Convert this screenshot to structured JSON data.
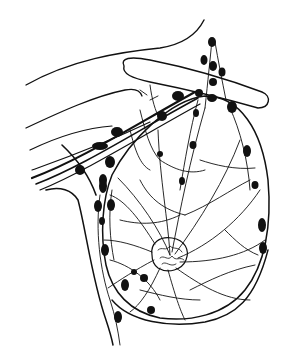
{
  "figure": {
    "width": 289,
    "height": 354,
    "background": "#ffffff",
    "ink": "#111111"
  },
  "outlines": [
    {
      "name": "shoulder-contour",
      "d": "M26 85 C70 60 120 52 160 48 C185 44 198 32 204 20",
      "w": 1.4
    },
    {
      "name": "arm-upper-contour",
      "d": "M26 128 C60 112 95 96 125 90 C135 88 140 90 142 96",
      "w": 1.3
    },
    {
      "name": "arm-lower-contour-1",
      "d": "M30 150 C55 138 85 128 112 126",
      "w": 1.2
    },
    {
      "name": "arm-lower-contour-2",
      "d": "M32 170 C60 160 95 148 150 122",
      "w": 1.2
    },
    {
      "name": "axillary-vessel-1",
      "d": "M32 178 C80 160 130 128 195 92",
      "w": 2.2
    },
    {
      "name": "axillary-vessel-2",
      "d": "M36 184 C85 165 135 132 198 98",
      "w": 1.6
    },
    {
      "name": "axillary-vessel-3",
      "d": "M40 190 C88 170 138 138 200 104",
      "w": 1.2
    },
    {
      "name": "clavicle",
      "d": "M124 66 C120 58 130 56 150 60 C190 68 230 80 262 92 C272 96 270 108 258 108 C230 100 190 90 150 82 C132 78 122 74 124 66 Z",
      "w": 1.4
    },
    {
      "name": "chest-wall",
      "d": "M46 190 C60 186 72 190 78 200 C86 230 92 280 106 320 C110 332 112 340 113 345",
      "w": 1.5
    },
    {
      "name": "breast-outline",
      "d": "M112 175 C130 140 170 100 205 96 C240 96 262 130 268 180 C272 225 265 265 245 290 C225 315 190 322 160 318 C130 312 112 292 106 265 C100 235 102 200 112 175 Z",
      "w": 1.5
    },
    {
      "name": "breast-lower-fold",
      "d": "M112 300 C130 322 170 328 205 322 C235 316 255 300 268 250",
      "w": 1.4
    },
    {
      "name": "pectoral-line",
      "d": "M62 145 C78 160 90 178 96 195",
      "w": 1.6
    },
    {
      "name": "nipple-areola",
      "d": "M152 255 C150 243 160 236 172 238 C185 240 190 250 186 260 C182 270 168 274 158 268 C154 265 152 260 152 255 Z",
      "w": 1.2
    }
  ],
  "lymph_vessels": [
    "M170 255 C160 230 140 200 118 178",
    "M170 255 C168 220 160 180 158 130",
    "M172 252 C180 210 190 160 205 108",
    "M175 254 C200 220 225 180 240 140",
    "M178 258 C210 245 240 220 260 190",
    "M180 262 C215 262 245 255 265 240",
    "M176 268 C200 285 225 300 250 300",
    "M168 270 C175 295 180 310 185 320",
    "M160 268 C150 290 140 305 130 312",
    "M154 260 C135 270 120 280 108 288",
    "M152 252 C135 245 118 240 104 240",
    "M155 244 C140 220 125 200 110 195",
    "M205 108 C208 80 210 60 212 40",
    "M215 42 C218 60 222 80 226 100",
    "M230 108 C240 130 248 160 250 190",
    "M198 100 C190 130 185 160 180 190",
    "M140 180 C150 200 165 210 185 215",
    "M185 215 C210 205 230 190 250 180",
    "M120 220 C140 225 160 225 180 215",
    "M110 260 C130 265 150 280 160 300",
    "M190 290 C210 280 230 270 255 265",
    "M130 130 C135 150 140 165 150 170",
    "M150 85 C152 100 155 110 160 120",
    "M147 95 L140 90 M150 100 L158 96",
    "M100 195 C95 230 100 270 110 300 C115 315 118 330 120 345",
    "M112 190 C108 215 110 240 114 260",
    "M140 110 C145 130 150 150 160 160",
    "M200 160 C215 165 235 170 255 168",
    "M160 160 C175 170 190 175 205 170",
    "M225 230 C235 240 245 250 258 255",
    "M140 290 C160 295 180 300 200 300"
  ],
  "lymph_nodes": [
    {
      "cx": 212,
      "cy": 42,
      "rx": 4,
      "ry": 5
    },
    {
      "cx": 204,
      "cy": 60,
      "rx": 3.5,
      "ry": 5
    },
    {
      "cx": 213,
      "cy": 66,
      "rx": 4,
      "ry": 5
    },
    {
      "cx": 222,
      "cy": 72,
      "rx": 3.5,
      "ry": 4.5
    },
    {
      "cx": 213,
      "cy": 82,
      "rx": 4,
      "ry": 4
    },
    {
      "cx": 178,
      "cy": 96,
      "rx": 6,
      "ry": 5
    },
    {
      "cx": 199,
      "cy": 93,
      "rx": 4,
      "ry": 4
    },
    {
      "cx": 212,
      "cy": 98,
      "rx": 5,
      "ry": 4
    },
    {
      "cx": 232,
      "cy": 107,
      "rx": 5,
      "ry": 6
    },
    {
      "cx": 162,
      "cy": 116,
      "rx": 5,
      "ry": 5
    },
    {
      "cx": 117,
      "cy": 132,
      "rx": 6,
      "ry": 5
    },
    {
      "cx": 100,
      "cy": 146,
      "rx": 8,
      "ry": 4
    },
    {
      "cx": 196,
      "cy": 113,
      "rx": 3,
      "ry": 4
    },
    {
      "cx": 193,
      "cy": 145,
      "rx": 3.5,
      "ry": 4
    },
    {
      "cx": 247,
      "cy": 151,
      "rx": 4,
      "ry": 6
    },
    {
      "cx": 160,
      "cy": 154,
      "rx": 3,
      "ry": 3
    },
    {
      "cx": 110,
      "cy": 162,
      "rx": 5,
      "ry": 6
    },
    {
      "cx": 80,
      "cy": 170,
      "rx": 5,
      "ry": 5
    },
    {
      "cx": 103,
      "cy": 180,
      "rx": 4,
      "ry": 6
    },
    {
      "cx": 103,
      "cy": 186,
      "rx": 4,
      "ry": 7
    },
    {
      "cx": 111,
      "cy": 205,
      "rx": 4,
      "ry": 6
    },
    {
      "cx": 182,
      "cy": 181,
      "rx": 3,
      "ry": 4
    },
    {
      "cx": 255,
      "cy": 185,
      "rx": 3.5,
      "ry": 4
    },
    {
      "cx": 98,
      "cy": 206,
      "rx": 4,
      "ry": 6
    },
    {
      "cx": 102,
      "cy": 221,
      "rx": 3,
      "ry": 4
    },
    {
      "cx": 262,
      "cy": 225,
      "rx": 4,
      "ry": 7
    },
    {
      "cx": 263,
      "cy": 248,
      "rx": 4,
      "ry": 6
    },
    {
      "cx": 105,
      "cy": 250,
      "rx": 4,
      "ry": 6
    },
    {
      "cx": 134,
      "cy": 272,
      "rx": 3,
      "ry": 3
    },
    {
      "cx": 144,
      "cy": 278,
      "rx": 4,
      "ry": 4
    },
    {
      "cx": 125,
      "cy": 285,
      "rx": 4,
      "ry": 6
    },
    {
      "cx": 151,
      "cy": 310,
      "rx": 4,
      "ry": 4
    },
    {
      "cx": 118,
      "cy": 317,
      "rx": 4,
      "ry": 6
    }
  ]
}
